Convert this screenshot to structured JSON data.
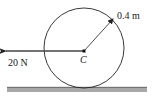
{
  "diagram": {
    "force_label": "20 N",
    "radius_label": "0.4 m",
    "center_label": "C",
    "colors": {
      "stroke": "#222222",
      "ground": "#9a9a9a",
      "ground_edge": "#555555",
      "background": "#ffffff"
    }
  }
}
